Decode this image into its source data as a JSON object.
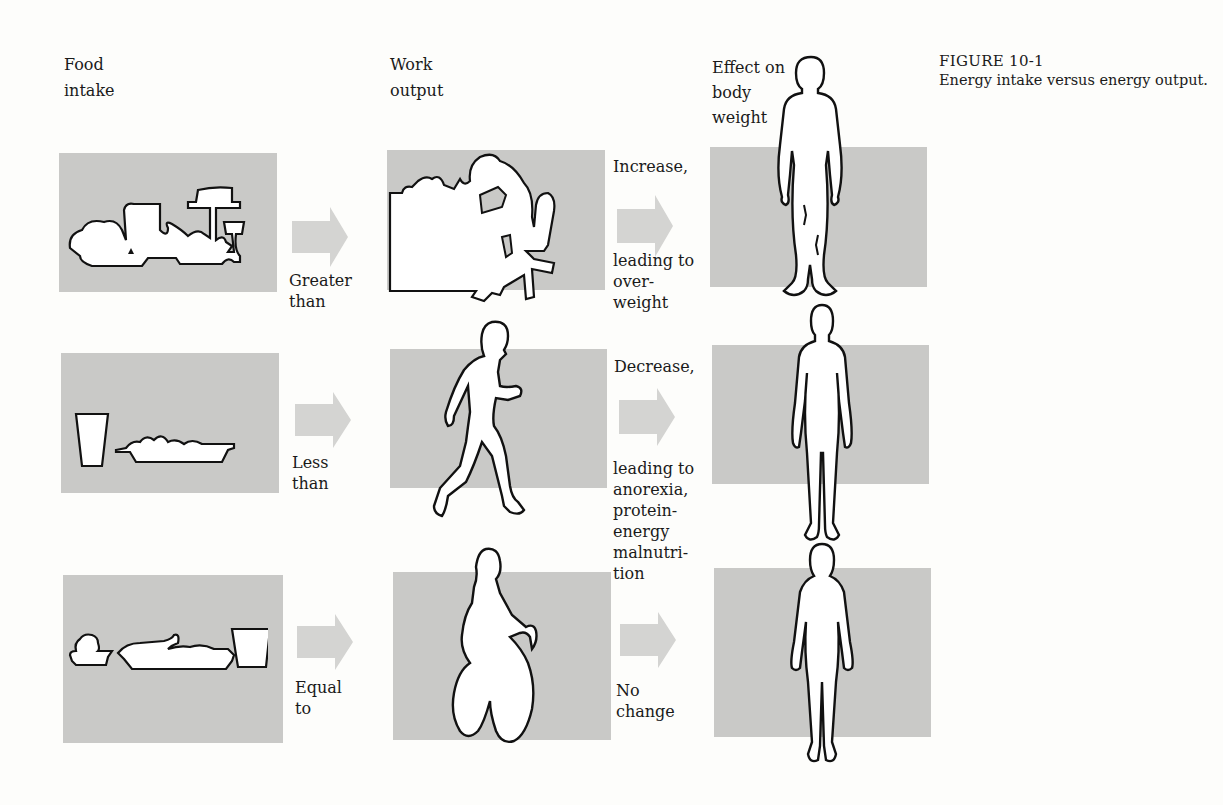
{
  "figure": {
    "number": "FIGURE 10-1",
    "caption": "Energy intake versus energy output."
  },
  "columns": {
    "food": [
      "Food",
      "intake"
    ],
    "work": [
      "Work",
      "output"
    ],
    "effect": [
      "Effect on",
      "body",
      "weight"
    ]
  },
  "rows": [
    {
      "food_icon": "banquet-table-icon",
      "comparison": [
        "Greater",
        "than"
      ],
      "work_icon": "person-at-desk-icon",
      "effect_title": "Increase,",
      "effect_detail": [
        "leading to",
        "over-",
        "weight"
      ],
      "body_icon": "heavy-figure-icon"
    },
    {
      "food_icon": "glass-and-dish-icon",
      "comparison": [
        "Less",
        "than"
      ],
      "work_icon": "walking-person-icon",
      "effect_title": "Decrease,",
      "effect_detail": [
        "leading to",
        "anorexia,",
        "protein-",
        "energy",
        "malnutri-",
        "tion"
      ],
      "body_icon": "thin-figure-icon"
    },
    {
      "food_icon": "balanced-meal-icon",
      "comparison": [
        "Equal",
        "to"
      ],
      "work_icon": "cyclist-icon",
      "effect_title": "No",
      "effect_detail": [
        "change"
      ],
      "body_icon": "normal-figure-icon"
    }
  ],
  "colors": {
    "panel": "#c9c9c7",
    "arrow": "#d4d4d2",
    "outline": "#111111",
    "background": "#fdfdfb"
  }
}
